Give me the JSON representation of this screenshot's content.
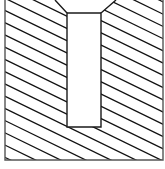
{
  "diagram": {
    "type": "cross-section",
    "colors": {
      "background": "#ffffff",
      "stroke": "#1a1a1a",
      "hatch": "#111111",
      "outline": "#555555"
    },
    "outer": {
      "x1": 5,
      "y1": 0,
      "x2": 163,
      "y2": 160
    },
    "slot": {
      "opening_left": 55,
      "opening_right": 116,
      "chamfer_y": 13,
      "left": 67,
      "right": 101,
      "bottom": 127
    },
    "hatch": {
      "angle_deg": 26,
      "spacing": 11
    }
  }
}
